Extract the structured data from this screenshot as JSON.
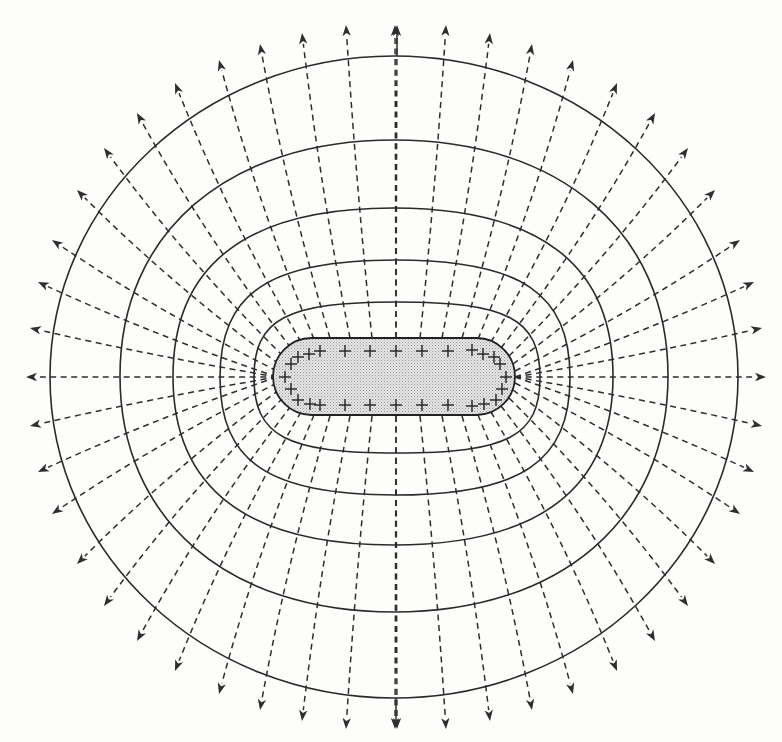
{
  "diagram": {
    "title": "Electric field lines and equipotential surfaces around a charged conductor",
    "center": [
      396,
      377
    ],
    "colors": {
      "ink": "#2e2e2e",
      "conductor_fill": "#d9d9d9",
      "background": "#fdfdfc"
    },
    "conductor": {
      "label": "positively charged elongated conductor",
      "x": 273,
      "y": 338,
      "width": 242,
      "height": 77,
      "charge_symbol": "+",
      "charges": [
        [
          320,
          351
        ],
        [
          345,
          351
        ],
        [
          370,
          351
        ],
        [
          396,
          351
        ],
        [
          422,
          351
        ],
        [
          448,
          351
        ],
        [
          472,
          350
        ],
        [
          483,
          354
        ],
        [
          494,
          357
        ],
        [
          500,
          364
        ],
        [
          506,
          377
        ],
        [
          502,
          389
        ],
        [
          496,
          400
        ],
        [
          484,
          404
        ],
        [
          472,
          406
        ],
        [
          448,
          405
        ],
        [
          422,
          405
        ],
        [
          396,
          405
        ],
        [
          370,
          405
        ],
        [
          345,
          405
        ],
        [
          320,
          405
        ],
        [
          310,
          404
        ],
        [
          298,
          400
        ],
        [
          291,
          389
        ],
        [
          285,
          377
        ],
        [
          291,
          364
        ],
        [
          298,
          357
        ],
        [
          309,
          354
        ]
      ]
    },
    "equipotentials": [
      {
        "name": "equipotential-1",
        "x": 254,
        "y": 302,
        "width": 286,
        "height": 151
      },
      {
        "name": "equipotential-2",
        "x": 220,
        "y": 260,
        "width": 350,
        "height": 235
      },
      {
        "name": "equipotential-3",
        "x": 173,
        "y": 208,
        "width": 440,
        "height": 337
      },
      {
        "name": "equipotential-4",
        "x": 120,
        "y": 140,
        "width": 548,
        "height": 472
      },
      {
        "name": "equipotential-5",
        "x": 50,
        "y": 56,
        "width": 688,
        "height": 642
      }
    ],
    "field_lines_quadrant": {
      "note": "top-right quadrant; mirrored to the other three quadrants",
      "starts": [
        [
          396,
          338
        ],
        [
          420,
          338
        ],
        [
          442,
          338
        ],
        [
          462,
          338
        ],
        [
          478,
          339
        ],
        [
          491,
          342
        ],
        [
          501,
          348
        ],
        [
          509,
          356
        ],
        [
          513,
          364
        ],
        [
          515,
          371
        ],
        [
          515,
          377
        ]
      ],
      "tips": [
        [
          397,
          25
        ],
        [
          446,
          25
        ],
        [
          490,
          33
        ],
        [
          532,
          44
        ],
        [
          573,
          60
        ],
        [
          617,
          83
        ],
        [
          655,
          113
        ],
        [
          688,
          148
        ],
        [
          715,
          190
        ],
        [
          740,
          240
        ],
        [
          754,
          282
        ]
      ],
      "extra_starts": [
        [
          515,
          377
        ],
        [
          515,
          377
        ]
      ],
      "extra_tips": [
        [
          762,
          328
        ],
        [
          766,
          377
        ]
      ]
    },
    "legend": {
      "field_line_style": "dashed lines with arrowheads (electric field)",
      "equipotential_style": "solid closed curves (equipotential surfaces)"
    }
  }
}
